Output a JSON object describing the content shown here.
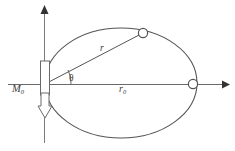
{
  "figure": {
    "kind": "orbital-mechanics-diagram",
    "background_color": "#ffffff",
    "stroke_color": "#555555",
    "label_color": "#3a3a3a",
    "width": 235,
    "height": 151,
    "labels": {
      "moment": "M",
      "moment_sub": "0",
      "radius": "r",
      "reference_radius": "r",
      "reference_radius_sub": "0",
      "angle": "θ"
    },
    "axes": {
      "origin_x": 45,
      "origin_y": 84,
      "horizontal_start_x": 8,
      "horizontal_end_x": 226,
      "vertical_top_y": 8,
      "vertical_bottom_y": 143
    },
    "ellipse": {
      "center_x": 121,
      "center_y": 83,
      "radius_x": 76,
      "radius_y": 55
    },
    "markers": [
      {
        "name": "orbiting-body-marker",
        "x": 143,
        "y": 33,
        "r": 5
      },
      {
        "name": "apsis-marker",
        "x": 193,
        "y": 84,
        "r": 5
      }
    ],
    "radius_line": {
      "x1": 45,
      "y1": 84,
      "x2": 141,
      "y2": 34
    },
    "angle_arc": {
      "radius": 26,
      "start_deg": 0,
      "end_deg": 27.5
    },
    "bar": {
      "x": 41,
      "y": 61,
      "width": 9,
      "height": 34
    },
    "moment_arrow": {
      "x": 45,
      "top_y": 93,
      "bottom_y": 117,
      "half_width": 6
    }
  }
}
